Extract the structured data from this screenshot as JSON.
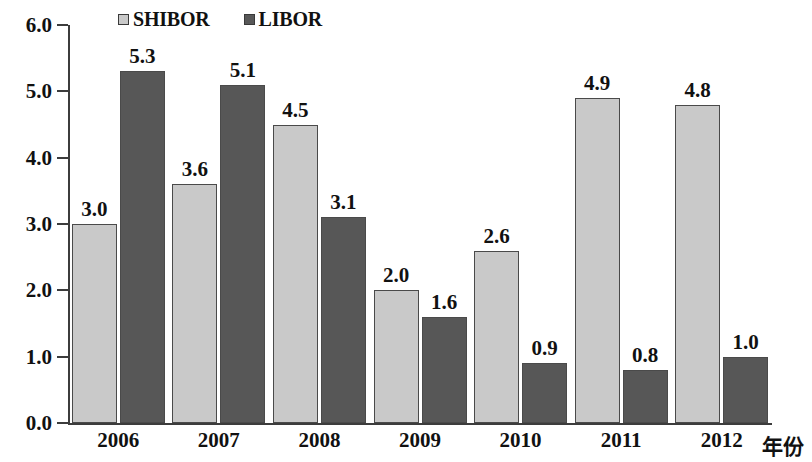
{
  "chart_data": {
    "type": "bar",
    "title": "",
    "subtitle": "",
    "xlabel": "年份",
    "ylabel": "",
    "categories": [
      "2006",
      "2007",
      "2008",
      "2009",
      "2010",
      "2011",
      "2012"
    ],
    "series": [
      {
        "name": "SHIBOR",
        "color": "#c9c9c9",
        "values": [
          3.0,
          3.6,
          4.5,
          2.0,
          2.6,
          4.9,
          4.8
        ]
      },
      {
        "name": "LIBOR",
        "color": "#575757",
        "values": [
          5.3,
          5.1,
          3.1,
          1.6,
          0.9,
          0.8,
          1.0
        ]
      }
    ],
    "data_labels": [
      [
        "3.0",
        "3.6",
        "4.5",
        "2.0",
        "2.6",
        "4.9",
        "4.8"
      ],
      [
        "5.3",
        "5.1",
        "3.1",
        "1.6",
        "0.9",
        "0.8",
        "1.0"
      ]
    ],
    "ylim": [
      0.0,
      6.0
    ],
    "ytick_values": [
      0.0,
      1.0,
      2.0,
      3.0,
      4.0,
      5.0,
      6.0
    ],
    "ytick_labels": [
      "0.0",
      "1.0",
      "2.0",
      "3.0",
      "4.0",
      "5.0",
      "6.0"
    ],
    "grid": false,
    "legend_position": "top-left",
    "show_data_labels": true
  },
  "legend": {
    "entries": [
      {
        "label": "SHIBOR",
        "swatch": "legend-swatch-shibor"
      },
      {
        "label": "LIBOR",
        "swatch": "legend-swatch-libor"
      }
    ]
  }
}
